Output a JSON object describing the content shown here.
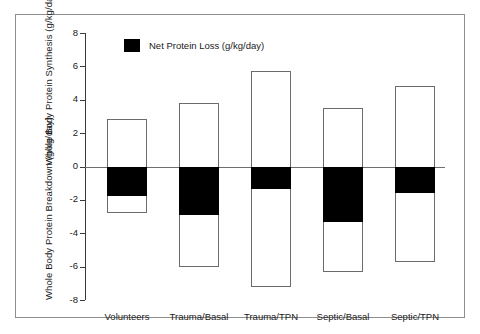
{
  "chart_data": {
    "type": "bar",
    "title": "",
    "subtitle": "",
    "xlabel": "",
    "ylabel_top": "Whole Body Protein Synthesis (g/kg/day)",
    "ylabel_bottom": "Whole Body Protein Breakdown (g/kg/day)",
    "ylim": [
      -8,
      8
    ],
    "yticks": [
      8,
      6,
      4,
      2,
      0,
      -2,
      -4,
      -6,
      -8
    ],
    "ytick_labels": [
      "8",
      "6",
      "4",
      "2",
      "0",
      "-2",
      "-4",
      "-6",
      "-8"
    ],
    "grid": false,
    "legend_position": "top-center",
    "legend": [
      {
        "label": "Net Protein Loss (g/kg/day)",
        "color": "#000000"
      }
    ],
    "categories": [
      "Volunteers",
      "Trauma/Basal",
      "Trauma/TPN",
      "Septic/Basal",
      "Septic/TPN"
    ],
    "series": [
      {
        "name": "Whole Body Protein Synthesis",
        "values": [
          2.85,
          3.8,
          5.75,
          3.5,
          4.85
        ]
      },
      {
        "name": "Whole Body Protein Breakdown",
        "values": [
          -2.8,
          -6.0,
          -7.2,
          -6.3,
          -5.7
        ]
      },
      {
        "name": "Net Protein Loss",
        "values": [
          -1.75,
          -2.9,
          -1.35,
          -3.3,
          -1.6
        ]
      }
    ],
    "bars": [
      {
        "category": "Volunteers",
        "synthesis": 2.85,
        "breakdown": -2.8,
        "net_loss": -1.75
      },
      {
        "category": "Trauma/Basal",
        "synthesis": 3.8,
        "breakdown": -6.0,
        "net_loss": -2.9
      },
      {
        "category": "Trauma/TPN",
        "synthesis": 5.75,
        "breakdown": -7.2,
        "net_loss": -1.35
      },
      {
        "category": "Septic/Basal",
        "synthesis": 3.5,
        "breakdown": -6.3,
        "net_loss": -3.3
      },
      {
        "category": "Septic/TPN",
        "synthesis": 4.85,
        "breakdown": -5.7,
        "net_loss": -1.6
      }
    ],
    "colors": {
      "bar_fill": "#ffffff",
      "bar_stroke": "#6b6b6b",
      "net_loss_fill": "#000000",
      "axis": "#3a3a3a",
      "zero_line": "#6e6e6e",
      "frame": "#8e8e8e",
      "text": "#1a1a1a"
    }
  }
}
